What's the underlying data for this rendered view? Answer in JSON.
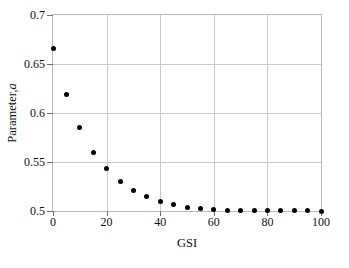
{
  "chart_data": {
    "type": "scatter",
    "title": "",
    "xlabel": "GSI",
    "ylabel": "Parameter, a",
    "ylabel_text": "Parameter,",
    "ylabel_symbol": "a",
    "xlim": [
      0,
      100
    ],
    "ylim": [
      0.5,
      0.7
    ],
    "xticks": [
      0,
      20,
      40,
      60,
      80,
      100
    ],
    "xticklabels": [
      "0",
      "20",
      "40",
      "60",
      "80",
      "100"
    ],
    "yticks": [
      0.5,
      0.55,
      0.6,
      0.65,
      0.7
    ],
    "yticklabels": [
      "0.5",
      "0.55",
      "0.6",
      "0.65",
      "0.7"
    ],
    "grid": true,
    "legend": "none",
    "marker": "filled-circle",
    "marker_color": "#000000",
    "x": [
      0,
      5,
      10,
      15,
      20,
      25,
      30,
      35,
      40,
      45,
      50,
      55,
      60,
      65,
      70,
      75,
      80,
      85,
      90,
      95,
      100
    ],
    "values": [
      0.666,
      0.619,
      0.585,
      0.56,
      0.543,
      0.53,
      0.521,
      0.515,
      0.51,
      0.507,
      0.504,
      0.503,
      0.502,
      0.501,
      0.5007,
      0.5005,
      0.5003,
      0.5002,
      0.5001,
      0.5001,
      0.5
    ]
  }
}
